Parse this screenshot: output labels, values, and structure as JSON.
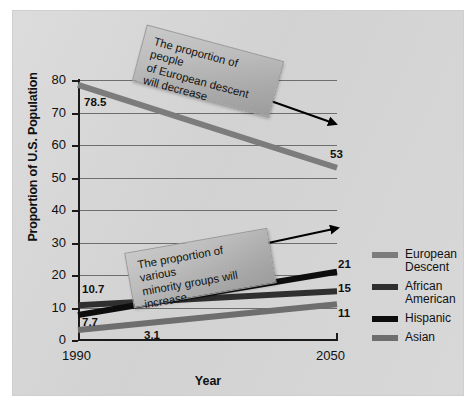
{
  "chart_data": {
    "type": "line",
    "title": "",
    "xlabel": "Year",
    "ylabel": "Proportion of U.S. Population",
    "x": [
      1990,
      2050
    ],
    "xtick_labels": [
      "1990",
      "2050"
    ],
    "ylim": [
      0,
      80
    ],
    "yticks": [
      0,
      10,
      20,
      30,
      40,
      50,
      60,
      70,
      80
    ],
    "ytick_labels": [
      "0",
      "10",
      "20",
      "30",
      "40",
      "50",
      "60",
      "70",
      "80"
    ],
    "grid": "horizontal",
    "legend_position": "right",
    "series": [
      {
        "name": "European Descent",
        "legend_label_line1": "European",
        "legend_label_line2": "Descent",
        "values": [
          78.5,
          53
        ],
        "start_label": "78.5",
        "end_label": "53",
        "color": "#7c7c7c"
      },
      {
        "name": "African American",
        "legend_label_line1": "African",
        "legend_label_line2": "American",
        "values": [
          10.7,
          15
        ],
        "start_label": "10.7",
        "end_label": "15",
        "color": "#2f2f2f"
      },
      {
        "name": "Hispanic",
        "legend_label_line1": "Hispanic",
        "legend_label_line2": "",
        "values": [
          7.7,
          21
        ],
        "start_label": "7.7",
        "end_label": "21",
        "color": "#0d0d0d"
      },
      {
        "name": "Asian",
        "legend_label_line1": "Asian",
        "legend_label_line2": "",
        "values": [
          3.1,
          11
        ],
        "start_label": "3.1",
        "end_label": "11",
        "color": "#6e6e6e"
      }
    ],
    "annotations": [
      {
        "id": "european-descent-callout",
        "text": "The proportion of people of European descent will decrease",
        "line1": "The proportion of people",
        "line2": "of European descent",
        "line3": "will decrease",
        "arrow": "down-right"
      },
      {
        "id": "minority-growth-callout",
        "text": "The proportion of various minority groups will increase",
        "line1": "The proportion of various",
        "line2": "minority groups will",
        "line3": "increase",
        "arrow": "up-right"
      }
    ],
    "colors": {
      "panel_background": "#d5d5d5",
      "axis": "#1a1a1a",
      "gridline": "#6e6e6e",
      "callout_fill": "#bdbdbd",
      "arrow": "#000000"
    }
  }
}
